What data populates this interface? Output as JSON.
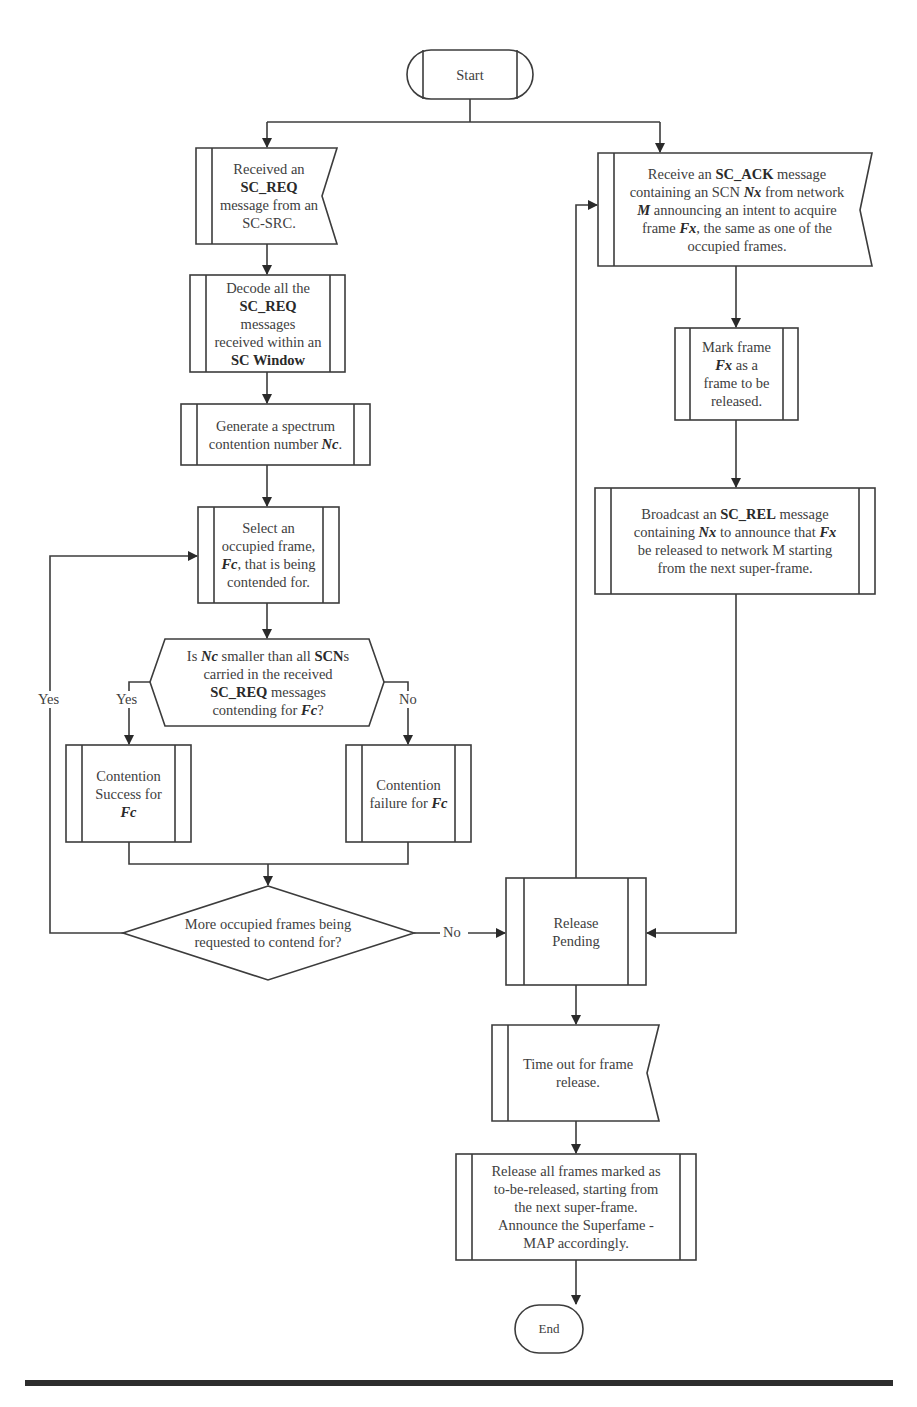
{
  "figure": {
    "type": "flowchart",
    "nodes": {
      "start": {
        "kind": "terminator",
        "text": "Start"
      },
      "received_req": {
        "kind": "receive-signal",
        "parts": [
          {
            "t": "Received an",
            "s": "n"
          },
          {
            "t": "SC_REQ",
            "s": "b"
          },
          {
            "t": "message from an",
            "s": "n"
          },
          {
            "t": "SC-SRC.",
            "s": "n"
          }
        ]
      },
      "decode": {
        "kind": "predefined-process",
        "parts": [
          {
            "t": "Decode all the",
            "s": "n"
          },
          {
            "t": "SC_REQ",
            "s": "b"
          },
          {
            "t": "messages",
            "s": "n"
          },
          {
            "t": "received within an",
            "s": "n"
          },
          {
            "t": "SC Window",
            "s": "b"
          }
        ]
      },
      "generate": {
        "kind": "predefined-process",
        "line1": "Generate a spectrum",
        "line2_prefix": "contention number ",
        "line2_var": "Nc",
        "line2_suffix": "."
      },
      "select": {
        "kind": "predefined-process",
        "line1": "Select an",
        "line2": "occupied frame,",
        "line3_var": "Fc",
        "line3_suffix": ", that is being",
        "line4": "contended for."
      },
      "question_nc": {
        "kind": "hexagon-decision",
        "l1_a": "Is ",
        "l1_var": "Nc",
        "l1_b": " smaller than all ",
        "l1_bold": "SCN",
        "l1_c": "s",
        "l2": "carried in the received",
        "l3_bold": "SC_REQ",
        "l3_b": " messages",
        "l4_a": "contending for  ",
        "l4_var": "Fc",
        "l4_b": "?"
      },
      "success": {
        "kind": "predefined-process",
        "line1": "Contention",
        "line2": "Success for",
        "line3_var": "Fc"
      },
      "failure": {
        "kind": "predefined-process",
        "line1": "Contention",
        "line2_prefix": "failure for ",
        "line2_var": "Fc"
      },
      "more_frames": {
        "kind": "decision",
        "line1": "More occupied frames being",
        "line2": "requested to contend for?"
      },
      "receive_ack": {
        "kind": "receive-signal",
        "l1_a": "Receive an ",
        "l1_bold": "SC_ACK",
        "l1_b": " message",
        "l2_a": "containing an SCN ",
        "l2_var": "Nx",
        "l2_b": " from network",
        "l3_var": "M",
        "l3_b": " announcing an intent to acquire",
        "l4_a": "frame ",
        "l4_var": "Fx",
        "l4_b": ", the same as one of the",
        "l5": "occupied frames."
      },
      "mark": {
        "kind": "predefined-process",
        "line1": "Mark frame",
        "line2_var": "Fx",
        "line2_suffix": " as a",
        "line3": "frame to be",
        "line4": "released."
      },
      "broadcast": {
        "kind": "predefined-process",
        "l1_a": "Broadcast an ",
        "l1_bold": "SC_REL",
        "l1_b": " message",
        "l2_a": "containing ",
        "l2_var": "Nx",
        "l2_b": " to announce that ",
        "l2_var2": "Fx",
        "l3": "be released to network M starting",
        "l4": "from the next super-frame."
      },
      "release_pending": {
        "kind": "predefined-process",
        "line1": "Release",
        "line2": "Pending"
      },
      "timeout": {
        "kind": "receive-signal",
        "line1": "Time out for frame",
        "line2": "release."
      },
      "release_all": {
        "kind": "predefined-process",
        "line1": "Release all frames marked as",
        "line2": "to-be-released, starting from",
        "line3": "the next super-frame.",
        "line4": "Announce the Superfame -",
        "line5": "MAP accordingly."
      },
      "end": {
        "kind": "terminator",
        "text": "End"
      }
    },
    "edge_labels": {
      "nc_yes": "Yes",
      "nc_no": "No",
      "more_yes": "Yes",
      "more_no": "No"
    },
    "edges": [
      [
        "start",
        "received_req"
      ],
      [
        "start",
        "receive_ack"
      ],
      [
        "received_req",
        "decode"
      ],
      [
        "decode",
        "generate"
      ],
      [
        "generate",
        "select"
      ],
      [
        "select",
        "question_nc"
      ],
      [
        "question_nc",
        "success",
        "Yes"
      ],
      [
        "question_nc",
        "failure",
        "No"
      ],
      [
        "success",
        "more_frames"
      ],
      [
        "failure",
        "more_frames"
      ],
      [
        "more_frames",
        "select",
        "Yes"
      ],
      [
        "more_frames",
        "release_pending",
        "No"
      ],
      [
        "receive_ack",
        "mark"
      ],
      [
        "mark",
        "broadcast"
      ],
      [
        "broadcast",
        "release_pending"
      ],
      [
        "release_pending",
        "receive_ack"
      ],
      [
        "release_pending",
        "timeout"
      ],
      [
        "timeout",
        "release_all"
      ],
      [
        "release_all",
        "end"
      ]
    ]
  },
  "colors": {
    "line": "#3c3c3c",
    "text": "#404040",
    "background": "#ffffff"
  }
}
